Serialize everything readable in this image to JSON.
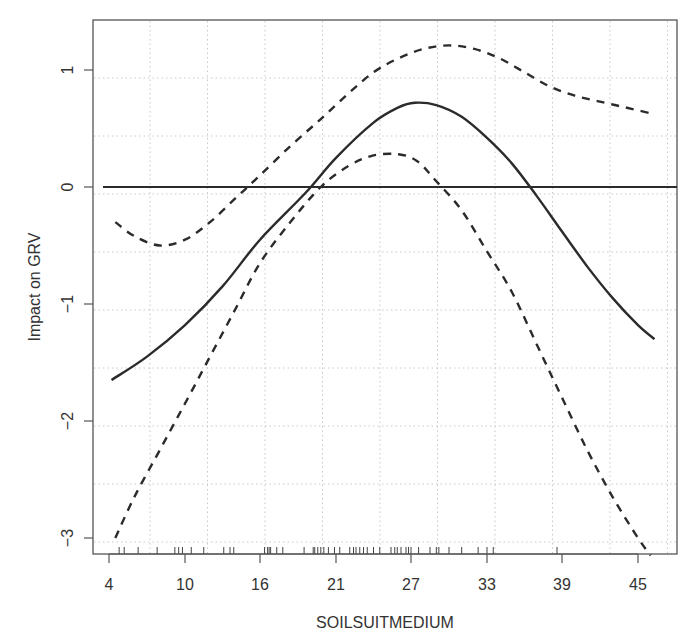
{
  "chart_data": {
    "type": "line",
    "title": "",
    "xlabel": "SOILSUITMEDIUM",
    "ylabel": "Impact on GRV",
    "x_tick_labels": [
      "4",
      "10",
      "16",
      "21",
      "27",
      "33",
      "39",
      "45"
    ],
    "y_tick_labels": [
      "-3",
      "-2",
      "-1",
      "0",
      "1"
    ],
    "y_ticks": [
      -3,
      -2,
      -1,
      0,
      1
    ],
    "ylim": [
      -3.15,
      1.43
    ],
    "grid": true,
    "legend": null,
    "reference_line": {
      "y": 0,
      "style": "solid"
    },
    "series": [
      {
        "name": "fitted effect",
        "style": "solid",
        "x": [
          4.2,
          7,
          10,
          13,
          16,
          19,
          21,
          24,
          26,
          27.3,
          29,
          31,
          33,
          35,
          37,
          39,
          41,
          43,
          45,
          46.3
        ],
        "y": [
          -1.65,
          -1.45,
          -1.18,
          -0.85,
          -0.45,
          -0.05,
          0.25,
          0.55,
          0.68,
          0.72,
          0.7,
          0.6,
          0.42,
          0.2,
          -0.08,
          -0.38,
          -0.68,
          -0.95,
          -1.18,
          -1.3
        ]
      },
      {
        "name": "upper confidence band",
        "style": "dashed",
        "x": [
          4.5,
          6,
          8,
          10,
          12,
          14,
          16,
          18,
          20,
          22,
          24,
          26,
          28,
          30,
          32,
          34,
          36,
          38,
          40,
          42,
          44,
          46
        ],
        "y": [
          -0.3,
          -0.42,
          -0.5,
          -0.45,
          -0.3,
          -0.1,
          0.1,
          0.35,
          0.58,
          0.8,
          0.98,
          1.1,
          1.18,
          1.21,
          1.18,
          1.1,
          0.98,
          0.86,
          0.78,
          0.73,
          0.68,
          0.63
        ]
      },
      {
        "name": "lower confidence band",
        "style": "dashed",
        "x": [
          4.5,
          6,
          8,
          10,
          12,
          14,
          16,
          18,
          20,
          22,
          24,
          26,
          27.5,
          29,
          31,
          33,
          35,
          37,
          39,
          41,
          43,
          45,
          46
        ],
        "y": [
          -3.0,
          -2.65,
          -2.25,
          -1.85,
          -1.45,
          -1.05,
          -0.65,
          -0.3,
          0.0,
          0.18,
          0.27,
          0.28,
          0.22,
          0.05,
          -0.2,
          -0.55,
          -0.9,
          -1.35,
          -1.8,
          -2.25,
          -2.65,
          -3.0,
          -3.15
        ]
      }
    ],
    "rug": [
      4.8,
      5.2,
      6.3,
      7.8,
      9.2,
      9.5,
      9.8,
      10.5,
      11.5,
      13.1,
      13.6,
      13.9,
      16.3,
      16.5,
      16.6,
      16.7,
      17.1,
      17.5,
      18.9,
      19.5,
      19.6,
      19.8,
      20.0,
      20.2,
      20.5,
      20.9,
      21.3,
      22.1,
      22.4,
      22.6,
      22.9,
      23.2,
      23.5,
      24.0,
      24.5,
      25.4,
      25.7,
      25.9,
      26.2,
      26.6,
      26.8,
      27.0,
      27.6,
      28.5,
      29.0,
      29.2,
      30.0,
      31.0,
      32.3,
      33.0,
      33.5,
      38.6
    ]
  },
  "plot": {
    "x_axis_label": "SOILSUITMEDIUM",
    "y_axis_label": "Impact on GRV",
    "x_ticks": [
      {
        "label": "4",
        "px": 109
      },
      {
        "label": "10",
        "px": 185
      },
      {
        "label": "16",
        "px": 260
      },
      {
        "label": "21",
        "px": 336
      },
      {
        "label": "27",
        "px": 411
      },
      {
        "label": "33",
        "px": 487
      },
      {
        "label": "39",
        "px": 562
      },
      {
        "label": "45",
        "px": 638
      }
    ],
    "y_ticks": [
      {
        "label": "1",
        "px": 70
      },
      {
        "label": "0",
        "px": 187
      },
      {
        "label": "−1",
        "px": 304
      },
      {
        "label": "−2",
        "px": 421
      },
      {
        "label": "−3",
        "px": 538
      }
    ],
    "colors": {
      "line": "#2b2b2b",
      "frame": "#555555",
      "grid": "#c8c8c8",
      "text": "#333333"
    }
  }
}
